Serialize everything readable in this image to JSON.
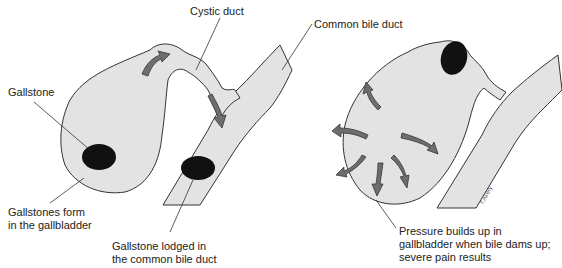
{
  "labels": {
    "cystic_duct": "Cystic duct",
    "common_bile_duct": "Common bile duct",
    "gallstone": "Gallstone",
    "gallstones_form_line1": "Gallstones form",
    "gallstones_form_line2": "in the gallbladder",
    "lodged_line1": "Gallstone lodged in",
    "lodged_line2": "the common bile duct",
    "pressure_line1": "Pressure builds up in",
    "pressure_line2": "gallbladder when bile dams up;",
    "pressure_line3": "severe pain results"
  },
  "colors": {
    "organ_fill": "#e3e3e3",
    "outline": "#333333",
    "stone": "#111111",
    "arrow": "#6e6e6e"
  },
  "panels": [
    {
      "name": "left",
      "description": "Gallstone formation and blockage"
    },
    {
      "name": "right",
      "description": "Pressure buildup in gallbladder"
    }
  ]
}
